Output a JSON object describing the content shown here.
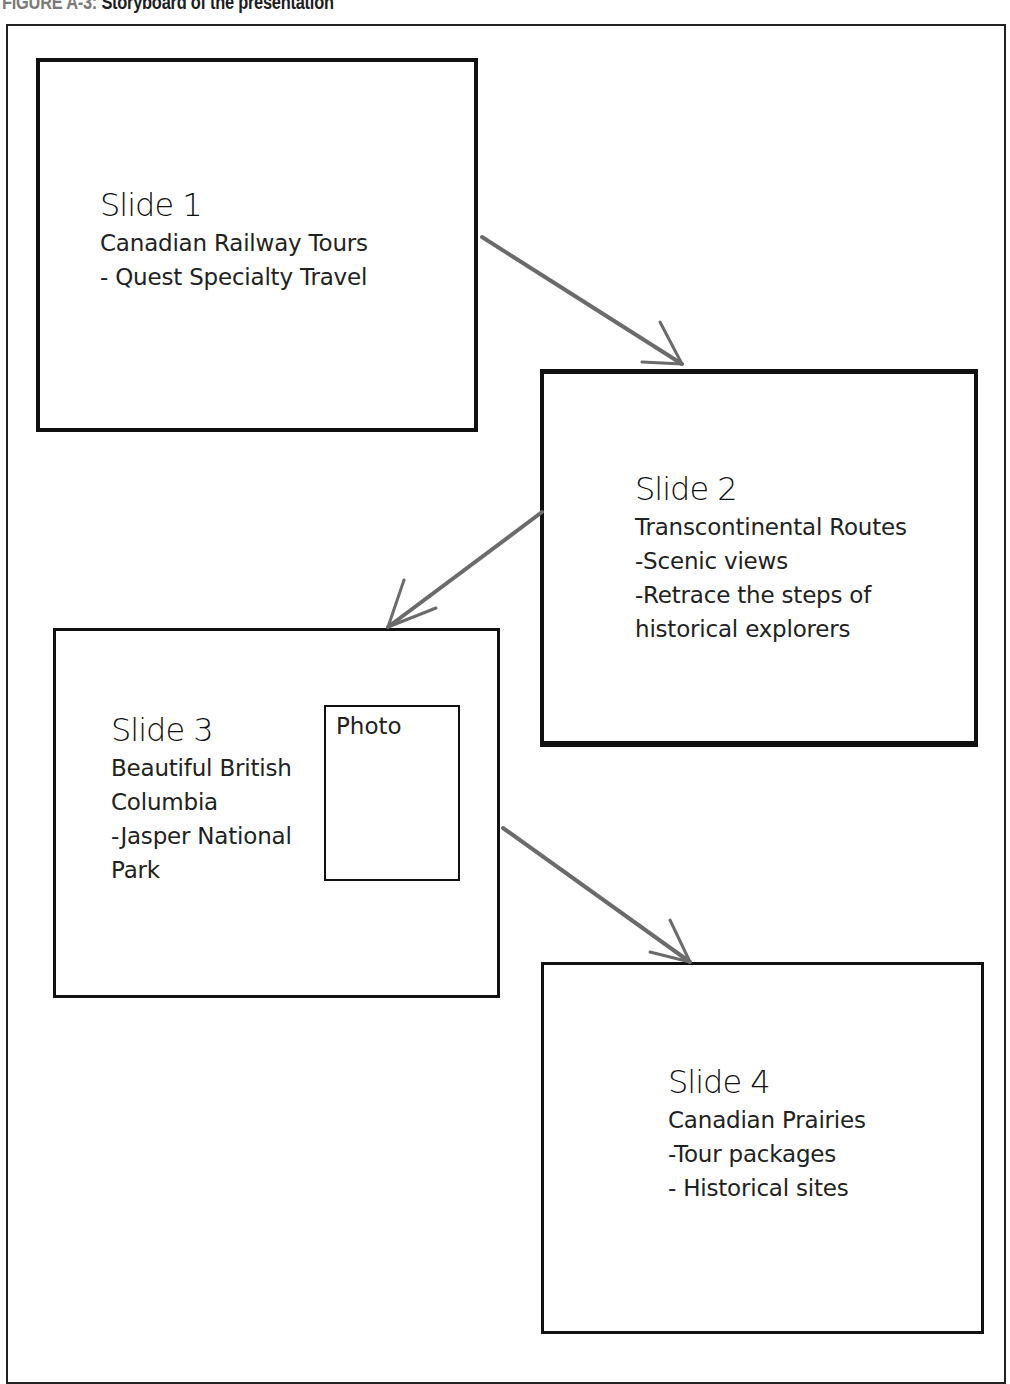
{
  "figure": {
    "label": "FIGURE A-3:",
    "title": "Storyboard of the presentation"
  },
  "colors": {
    "border": "#111111",
    "arrow": "#6b6b6b",
    "text": "#222222",
    "caption_label": "#7a7a7a"
  },
  "slides": [
    {
      "title": "Slide 1",
      "lines": [
        "Canadian Railway Tours",
        "- Quest Specialty Travel"
      ]
    },
    {
      "title": "Slide 2",
      "lines": [
        "Transcontinental Routes",
        "-Scenic views",
        "-Retrace the steps of",
        "historical explorers"
      ]
    },
    {
      "title": "Slide 3",
      "lines": [
        "Beautiful British",
        "Columbia",
        "-Jasper National",
        "Park"
      ],
      "photo_label": "Photo"
    },
    {
      "title": "Slide 4",
      "lines": [
        "Canadian Prairies",
        "-Tour packages",
        "- Historical sites"
      ]
    }
  ],
  "arrows": [
    {
      "from": "Slide 1",
      "to": "Slide 2"
    },
    {
      "from": "Slide 2",
      "to": "Slide 3"
    },
    {
      "from": "Slide 3",
      "to": "Slide 4"
    }
  ]
}
